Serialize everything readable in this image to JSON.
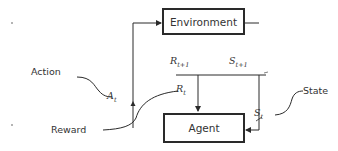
{
  "diagram": {
    "type": "reinforcement-learning-loop",
    "nodes": {
      "environment": {
        "label": "Environment"
      },
      "agent": {
        "label": "Agent"
      }
    },
    "signals": {
      "action": {
        "symbol": "A",
        "subscript": "t"
      },
      "reward_current": {
        "symbol": "R",
        "subscript": "t"
      },
      "reward_next": {
        "symbol": "R",
        "subscript": "t+1"
      },
      "state_current": {
        "symbol": "S",
        "subscript": "t"
      },
      "state_next": {
        "symbol": "S",
        "subscript": "t+1"
      }
    },
    "annotations": {
      "action": "Action",
      "reward": "Reward",
      "state": "State"
    },
    "colors": {
      "stroke": "#2a2a2a",
      "text": "#333333",
      "background": "#ffffff"
    }
  }
}
